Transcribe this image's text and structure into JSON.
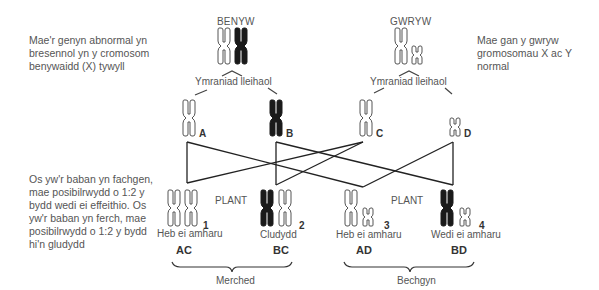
{
  "notes": {
    "left_top": [
      "Mae'r genyn abnormal yn",
      "bresennol yn y cromosom",
      "benywaidd (X) tywyll"
    ],
    "right_top": [
      "Mae gan y gwryw",
      "gromosomau X ac Y normal"
    ],
    "left_bottom": [
      "Os yw'r baban yn fachgen,",
      "mae posibilrwydd o 1:2 y",
      "bydd wedi ei effeithio. Os",
      "yw'r baban yn ferch, mae",
      "posibilrwydd o 1:2 y bydd",
      "hi'n gludydd"
    ]
  },
  "parents": {
    "female": {
      "label": "BENYW",
      "chromosomes": [
        "X (normal, light)",
        "X (abnormal, dark)"
      ]
    },
    "male": {
      "label": "GWRYW",
      "chromosomes": [
        "X (normal, light)",
        "Y (normal, small)"
      ]
    }
  },
  "meiosis_label": "Ymraniad lleihaol",
  "gametes": [
    {
      "id": "A",
      "label": "A",
      "type": "X light"
    },
    {
      "id": "B",
      "label": "B",
      "type": "X dark"
    },
    {
      "id": "C",
      "label": "C",
      "type": "X light"
    },
    {
      "id": "D",
      "label": "D",
      "type": "Y light"
    }
  ],
  "offspring_header": "PLANT",
  "offspring": [
    {
      "number": "1",
      "status": "Heb ei amharu",
      "genotype": "AC"
    },
    {
      "number": "2",
      "status": "Cludydd",
      "genotype": "BC"
    },
    {
      "number": "3",
      "status": "Heb ei amharu",
      "genotype": "AD"
    },
    {
      "number": "4",
      "status": "Wedi ei amharu",
      "genotype": "BD"
    }
  ],
  "groups": {
    "daughters": "Merched",
    "sons": "Bechgyn"
  },
  "colors": {
    "dark_chromosome": "#1a1a1a",
    "outline": "#555555",
    "line": "#222222"
  }
}
